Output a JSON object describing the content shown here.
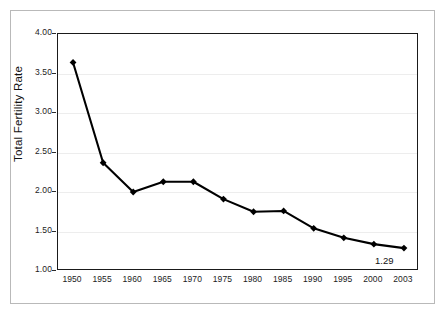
{
  "chart_data": {
    "type": "line",
    "title": "",
    "xlabel": "",
    "ylabel": "Total Fertility Rate",
    "categories": [
      "1950",
      "1955",
      "1960",
      "1965",
      "1970",
      "1975",
      "1980",
      "1985",
      "1990",
      "1995",
      "2000",
      "2003"
    ],
    "values": [
      3.64,
      2.37,
      2.0,
      2.13,
      2.13,
      1.91,
      1.75,
      1.76,
      1.54,
      1.42,
      1.34,
      1.29
    ],
    "series": [
      {
        "name": "Total Fertility Rate",
        "values": [
          3.64,
          2.37,
          2.0,
          2.13,
          2.13,
          1.91,
          1.75,
          1.76,
          1.54,
          1.42,
          1.34,
          1.29
        ]
      }
    ],
    "ylim": [
      1.0,
      4.0
    ],
    "ytick_labels": [
      "4.00",
      "3.50",
      "3.00",
      "2.50",
      "2.00",
      "1.50",
      "1.00"
    ],
    "ytick_values": [
      4.0,
      3.5,
      3.0,
      2.5,
      2.0,
      1.5,
      1.0
    ],
    "grid": true,
    "grid_axis": "y",
    "legend": false,
    "legend_position": "none",
    "annotations": [
      {
        "text": "1.29",
        "x_category": "2003",
        "y_value": 1.29
      }
    ],
    "marker": "diamond",
    "line_color": "#000000",
    "marker_color": "#000000",
    "grid_color": "#ededed",
    "axis_color": "#1a1a1a",
    "frame_color": "#b9b9b9",
    "background_color": "#ffffff"
  }
}
